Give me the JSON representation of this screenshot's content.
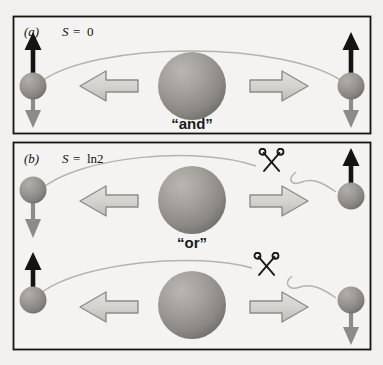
{
  "figure": {
    "background_color": "#f2f0ee",
    "panels": [
      {
        "id": "a",
        "label": "(a)",
        "entropy_symbol": "S",
        "entropy_equals": "=",
        "entropy_value": "0",
        "entropy_full": "S = 0",
        "conjunction": "“and”",
        "frame": {
          "x": 13,
          "y": 16,
          "w": 358,
          "h": 118
        },
        "center_sphere": {
          "cx": 192,
          "cy": 86,
          "r": 34
        },
        "left_arrow": {
          "name": "big-left-arrow",
          "direction": "left"
        },
        "right_arrow": {
          "name": "big-right-arrow",
          "direction": "right"
        },
        "particles": [
          {
            "side": "left",
            "spin_up": true,
            "spin_down": true,
            "cx": 33,
            "cy": 86,
            "r": 13
          },
          {
            "side": "right",
            "spin_up": true,
            "spin_down": true,
            "cx": 351,
            "cy": 86,
            "r": 13
          }
        ],
        "correlation_curve": "connected",
        "scissors": []
      },
      {
        "id": "b",
        "label": "(b)",
        "entropy_symbol": "S",
        "entropy_equals": "=",
        "entropy_value": "ln2",
        "entropy_full": "S = ln2",
        "conjunction": "“or”",
        "frame": {
          "x": 13,
          "y": 142,
          "w": 358,
          "h": 208
        },
        "center_sphere_top": {
          "cx": 192,
          "cy": 200,
          "r": 34
        },
        "center_sphere_bottom": {
          "cx": 192,
          "cy": 305,
          "r": 34
        },
        "conjunction_y": 246,
        "rows": [
          {
            "row": "top",
            "left_particle": {
              "spin_up": false,
              "spin_down": true,
              "cx": 33,
              "cy": 190,
              "r": 13
            },
            "right_particle": {
              "spin_up": true,
              "spin_down": false,
              "cx": 351,
              "cy": 196,
              "r": 13
            },
            "correlation_curve": "cut",
            "scissors": {
              "x": 262,
              "y": 158
            }
          },
          {
            "row": "bottom",
            "left_particle": {
              "spin_up": true,
              "spin_down": false,
              "cx": 33,
              "cy": 300,
              "r": 13
            },
            "right_particle": {
              "spin_up": false,
              "spin_down": true,
              "cx": 351,
              "cy": 300,
              "r": 13
            },
            "correlation_curve": "cut",
            "scissors": {
              "x": 258,
              "y": 262
            }
          }
        ]
      }
    ],
    "colors": {
      "frame_stroke": "#17140f",
      "sphere_light": "#b4b1ac",
      "sphere_dark": "#6e6c69",
      "big_arrow_fill": "#d6d4d1",
      "big_arrow_stroke": "#8d8b88",
      "spin_up_arrow": "#15120f",
      "spin_down_arrow": "#8d8b87",
      "curve_stroke": "#b6b3ae",
      "scissors_stroke": "#1a1714",
      "text_color": "#14100e"
    }
  }
}
